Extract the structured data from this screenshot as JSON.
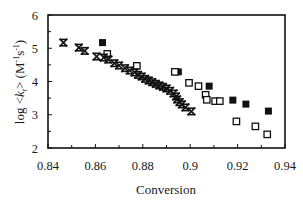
{
  "chart_data": {
    "type": "scatter",
    "title": "",
    "xlabel": "Conversion",
    "ylabel": "log <k_t> (M⁻¹s⁻¹)",
    "ylabel_parts": {
      "prefix": "log <",
      "k": "k",
      "sub": "t",
      "suffix": "> (M",
      "sup1": "-1",
      "s": "s",
      "sup2": "-1",
      "close": ")"
    },
    "xlim": [
      0.84,
      0.94
    ],
    "ylim": [
      2,
      6
    ],
    "xticks": [
      0.84,
      0.86,
      0.88,
      0.9,
      0.92,
      0.94
    ],
    "xtick_labels": [
      "0.84",
      "0.86",
      "0.88",
      "0.9",
      "0.92",
      "0.94"
    ],
    "yticks": [
      2,
      3,
      4,
      5,
      6
    ],
    "ytick_labels": [
      "2",
      "3",
      "4",
      "5",
      "6"
    ],
    "grid": false,
    "legend": null,
    "series": [
      {
        "name": "filled squares",
        "marker": "filled-square",
        "color": "#111111",
        "points": [
          [
            0.863,
            5.17
          ],
          [
            0.895,
            4.29
          ],
          [
            0.908,
            3.86
          ],
          [
            0.918,
            3.44
          ],
          [
            0.9235,
            3.32
          ],
          [
            0.933,
            3.11
          ]
        ]
      },
      {
        "name": "open squares",
        "marker": "open-square",
        "color": "#111111",
        "points": [
          [
            0.865,
            4.83
          ],
          [
            0.8775,
            4.47
          ],
          [
            0.8935,
            4.29
          ],
          [
            0.8995,
            3.96
          ],
          [
            0.9035,
            3.86
          ],
          [
            0.9065,
            3.6
          ],
          [
            0.907,
            3.45
          ],
          [
            0.9105,
            3.41
          ],
          [
            0.9125,
            3.41
          ],
          [
            0.9195,
            2.8
          ],
          [
            0.9275,
            2.65
          ],
          [
            0.9325,
            2.41
          ]
        ]
      },
      {
        "name": "stars",
        "marker": "star",
        "color": "#111111",
        "points": [
          [
            0.8465,
            5.17
          ],
          [
            0.853,
            5.02
          ],
          [
            0.8555,
            4.92
          ],
          [
            0.8605,
            4.75
          ],
          [
            0.8635,
            4.72
          ],
          [
            0.8655,
            4.66
          ],
          [
            0.868,
            4.55
          ],
          [
            0.87,
            4.48
          ],
          [
            0.8725,
            4.4
          ],
          [
            0.8745,
            4.33
          ],
          [
            0.8765,
            4.27
          ],
          [
            0.878,
            4.2
          ],
          [
            0.8795,
            4.15
          ],
          [
            0.881,
            4.08
          ],
          [
            0.8825,
            4.03
          ],
          [
            0.884,
            3.98
          ],
          [
            0.8855,
            3.93
          ],
          [
            0.887,
            3.88
          ],
          [
            0.8885,
            3.84
          ],
          [
            0.89,
            3.79
          ],
          [
            0.8915,
            3.72
          ],
          [
            0.893,
            3.64
          ],
          [
            0.894,
            3.55
          ],
          [
            0.8945,
            3.46
          ],
          [
            0.8955,
            3.38
          ],
          [
            0.8965,
            3.31
          ],
          [
            0.898,
            3.22
          ],
          [
            0.9005,
            3.1
          ]
        ]
      }
    ]
  },
  "colors": {
    "ink": "#111111",
    "background": "#ffffff"
  }
}
